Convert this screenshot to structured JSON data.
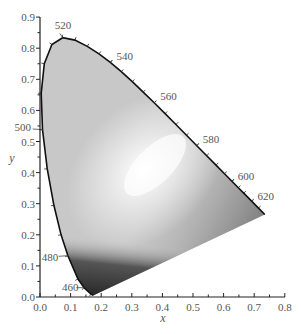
{
  "chart_data": {
    "type": "area",
    "xlabel": "x",
    "ylabel": "y",
    "xlim": [
      0.0,
      0.8
    ],
    "ylim": [
      0.0,
      0.9
    ],
    "x_ticks": [
      "0.0",
      "0.1",
      "0.2",
      "0.3",
      "0.4",
      "0.5",
      "0.6",
      "0.7",
      "0.8"
    ],
    "y_ticks": [
      "0.0",
      "0.1",
      "0.2",
      "0.3",
      "0.4",
      "0.5",
      "0.6",
      "0.7",
      "0.8",
      "0.9"
    ],
    "grid": false,
    "legend": null,
    "spectral_locus_labels": [
      {
        "nm": "460",
        "x": 0.144,
        "y": 0.03
      },
      {
        "nm": "480",
        "x": 0.091,
        "y": 0.133
      },
      {
        "nm": "500",
        "x": 0.008,
        "y": 0.538
      },
      {
        "nm": "520",
        "x": 0.074,
        "y": 0.834
      },
      {
        "nm": "540",
        "x": 0.23,
        "y": 0.754
      },
      {
        "nm": "560",
        "x": 0.373,
        "y": 0.624
      },
      {
        "nm": "580",
        "x": 0.512,
        "y": 0.487
      },
      {
        "nm": "600",
        "x": 0.627,
        "y": 0.372
      },
      {
        "nm": "620",
        "x": 0.691,
        "y": 0.308
      }
    ],
    "locus_points": [
      [
        0.1741,
        0.005
      ],
      [
        0.1666,
        0.0089
      ],
      [
        0.144,
        0.0297
      ],
      [
        0.1241,
        0.0578
      ],
      [
        0.0913,
        0.1327
      ],
      [
        0.0687,
        0.2007
      ],
      [
        0.0454,
        0.295
      ],
      [
        0.0235,
        0.4127
      ],
      [
        0.0082,
        0.5384
      ],
      [
        0.0039,
        0.6548
      ],
      [
        0.0139,
        0.7502
      ],
      [
        0.0389,
        0.812
      ],
      [
        0.0743,
        0.8338
      ],
      [
        0.1142,
        0.8262
      ],
      [
        0.1547,
        0.8059
      ],
      [
        0.1929,
        0.7816
      ],
      [
        0.2296,
        0.7543
      ],
      [
        0.2658,
        0.7243
      ],
      [
        0.3016,
        0.6923
      ],
      [
        0.3373,
        0.6589
      ],
      [
        0.3731,
        0.6245
      ],
      [
        0.4087,
        0.5896
      ],
      [
        0.4441,
        0.5547
      ],
      [
        0.4788,
        0.5202
      ],
      [
        0.5125,
        0.4866
      ],
      [
        0.5448,
        0.4544
      ],
      [
        0.5752,
        0.4242
      ],
      [
        0.6029,
        0.3965
      ],
      [
        0.627,
        0.3725
      ],
      [
        0.6482,
        0.3514
      ],
      [
        0.6658,
        0.334
      ],
      [
        0.6915,
        0.3083
      ],
      [
        0.714,
        0.2859
      ],
      [
        0.7347,
        0.2653
      ]
    ]
  }
}
